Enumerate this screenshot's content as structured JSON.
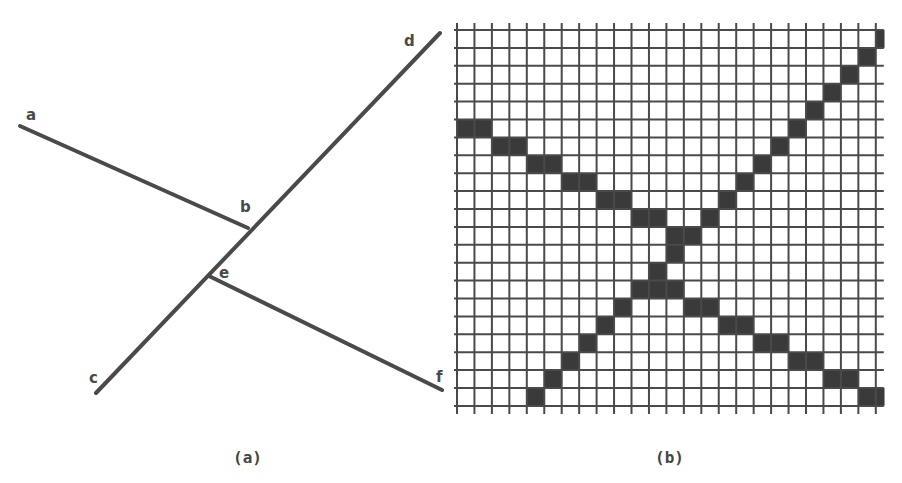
{
  "figure": {
    "panel_a": {
      "caption": "(a)",
      "segments": [
        {
          "name": "segment-a-b",
          "from": "a",
          "to": "b"
        },
        {
          "name": "segment-c-d",
          "from": "c",
          "to": "d"
        },
        {
          "name": "segment-e-f",
          "from": "e",
          "to": "f"
        }
      ],
      "point_labels": {
        "a": "a",
        "b": "b",
        "c": "c",
        "d": "d",
        "e": "e",
        "f": "f"
      }
    },
    "panel_b": {
      "caption": "(b)",
      "grid": {
        "columns": 24,
        "rows": 21
      },
      "filled_cells": [
        [
          23,
          1
        ],
        [
          22,
          2
        ],
        [
          21,
          3
        ],
        [
          20,
          4
        ],
        [
          0,
          5
        ],
        [
          1,
          5
        ],
        [
          19,
          5
        ],
        [
          2,
          6
        ],
        [
          3,
          6
        ],
        [
          18,
          6
        ],
        [
          4,
          7
        ],
        [
          5,
          7
        ],
        [
          17,
          7
        ],
        [
          6,
          8
        ],
        [
          7,
          8
        ],
        [
          16,
          8
        ],
        [
          8,
          9
        ],
        [
          9,
          9
        ],
        [
          15,
          9
        ],
        [
          10,
          10
        ],
        [
          11,
          10
        ],
        [
          14,
          10
        ],
        [
          12,
          11
        ],
        [
          13,
          11
        ],
        [
          12,
          12
        ],
        [
          11,
          13
        ],
        [
          10,
          14
        ],
        [
          11,
          14
        ],
        [
          12,
          14
        ],
        [
          9,
          15
        ],
        [
          13,
          15
        ],
        [
          14,
          15
        ],
        [
          8,
          16
        ],
        [
          15,
          16
        ],
        [
          16,
          16
        ],
        [
          7,
          17
        ],
        [
          17,
          17
        ],
        [
          18,
          17
        ],
        [
          6,
          18
        ],
        [
          19,
          18
        ],
        [
          20,
          18
        ],
        [
          5,
          19
        ],
        [
          21,
          19
        ],
        [
          22,
          19
        ],
        [
          4,
          20
        ],
        [
          23,
          20
        ]
      ],
      "partial_cells": [
        [
          24,
          0
        ],
        [
          24,
          20
        ]
      ]
    }
  },
  "colors": {
    "ink": "#4a4a4a",
    "fill": "#3a3a3a",
    "background": "#ffffff"
  }
}
